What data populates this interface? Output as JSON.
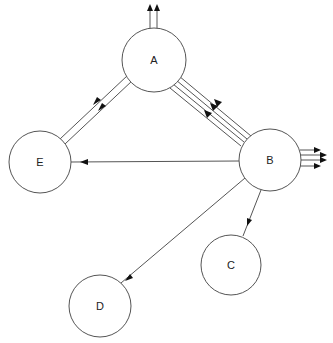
{
  "diagram": {
    "type": "directed-graph",
    "colors": {
      "stroke": "#555555",
      "arrow": "#111111",
      "background": "#ffffff"
    },
    "nodes": [
      {
        "id": "A",
        "label": "A",
        "cx": 154,
        "cy": 60,
        "r": 32
      },
      {
        "id": "B",
        "label": "B",
        "cx": 270,
        "cy": 160,
        "r": 31
      },
      {
        "id": "C",
        "label": "C",
        "cx": 231,
        "cy": 265,
        "r": 30
      },
      {
        "id": "D",
        "label": "D",
        "cx": 100,
        "cy": 306,
        "r": 31
      },
      {
        "id": "E",
        "label": "E",
        "cx": 40,
        "cy": 162,
        "r": 31
      }
    ],
    "edges": [
      {
        "from": "A",
        "to": "external-top",
        "count": 2
      },
      {
        "from": "A",
        "to": "E",
        "count": 2
      },
      {
        "from": "B",
        "to": "A",
        "count": 3,
        "parallel_lines": 4
      },
      {
        "from": "B",
        "to": "E",
        "count": 1
      },
      {
        "from": "B",
        "to": "C",
        "count": 1
      },
      {
        "from": "B",
        "to": "D",
        "count": 1
      },
      {
        "from": "B",
        "to": "external-right",
        "count": 4
      }
    ]
  }
}
